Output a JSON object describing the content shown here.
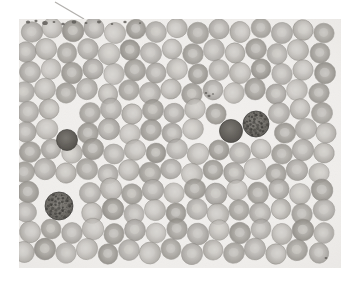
{
  "figure": {
    "kind": "micrograph",
    "title": "",
    "caption": "",
    "page_background": "#ffffff"
  },
  "micrograph": {
    "name": "blood-smear-micrograph",
    "frame": {
      "x": 19,
      "y": 19,
      "width": 322,
      "height": 249
    },
    "field_background": "#f2f0ee",
    "vignette_color": "#e8e5e2",
    "colors": {
      "rbc_fill": "#a9a7a4",
      "rbc_fill_light": "#b9b7b3",
      "rbc_fill_dark": "#98958f",
      "rbc_edge": "#8e8b86",
      "rbc_pallor": "#cfcdc9",
      "leukocyte_dark": "#5e5c5a",
      "leukocyte_granular": "#6e6b66",
      "leukocyte_granule": "#3f3d3a",
      "debris": "#5a5854",
      "pointer": "#b2b0ad"
    },
    "annotations": {
      "pointer_line": {
        "label": "pointer-leader-line",
        "x1": 55,
        "y1": 2,
        "x2": 84,
        "y2": 19,
        "stroke": "#b2b0ad",
        "width": 1.3
      }
    },
    "cells": {
      "erythrocyte_count": 168,
      "leukocyte_count": 3,
      "erythrocytes": [
        [
          32,
          32,
          10.5,
          0.86
        ],
        [
          52,
          28,
          10.0,
          0.8
        ],
        [
          73,
          31,
          10.8,
          0.92
        ],
        [
          94,
          28,
          10.2,
          0.84
        ],
        [
          115,
          33,
          10.6,
          0.78
        ],
        [
          136,
          29,
          9.8,
          0.9
        ],
        [
          156,
          32,
          10.4,
          0.82
        ],
        [
          177,
          28,
          10.0,
          0.88
        ],
        [
          198,
          33,
          10.7,
          0.8
        ],
        [
          219,
          29,
          10.1,
          0.86
        ],
        [
          240,
          32,
          10.3,
          0.9
        ],
        [
          261,
          28,
          9.9,
          0.78
        ],
        [
          282,
          33,
          10.6,
          0.84
        ],
        [
          303,
          30,
          10.2,
          0.92
        ],
        [
          324,
          33,
          10.0,
          0.8
        ],
        [
          26,
          52,
          10.2,
          0.84
        ],
        [
          46,
          49,
          10.6,
          0.9
        ],
        [
          67,
          53,
          10.0,
          0.78
        ],
        [
          88,
          49,
          10.4,
          0.86
        ],
        [
          109,
          54,
          10.8,
          0.82
        ],
        [
          130,
          50,
          10.1,
          0.92
        ],
        [
          151,
          53,
          10.5,
          0.8
        ],
        [
          172,
          49,
          9.9,
          0.88
        ],
        [
          193,
          54,
          10.3,
          0.84
        ],
        [
          214,
          50,
          10.7,
          0.78
        ],
        [
          235,
          53,
          10.0,
          0.9
        ],
        [
          256,
          49,
          10.4,
          0.86
        ],
        [
          277,
          54,
          10.2,
          0.82
        ],
        [
          298,
          50,
          10.6,
          0.88
        ],
        [
          320,
          53,
          10.0,
          0.84
        ],
        [
          30,
          72,
          10.5,
          0.88
        ],
        [
          51,
          69,
          10.0,
          0.8
        ],
        [
          72,
          73,
          10.7,
          0.86
        ],
        [
          93,
          69,
          10.2,
          0.92
        ],
        [
          114,
          74,
          10.4,
          0.78
        ],
        [
          135,
          70,
          10.8,
          0.84
        ],
        [
          156,
          73,
          10.1,
          0.9
        ],
        [
          177,
          69,
          10.5,
          0.82
        ],
        [
          198,
          74,
          9.9,
          0.88
        ],
        [
          219,
          70,
          10.3,
          0.8
        ],
        [
          240,
          73,
          10.6,
          0.86
        ],
        [
          261,
          69,
          10.0,
          0.92
        ],
        [
          282,
          74,
          10.4,
          0.78
        ],
        [
          303,
          70,
          10.2,
          0.84
        ],
        [
          325,
          73,
          10.6,
          0.9
        ],
        [
          24,
          92,
          10.3,
          0.82
        ],
        [
          45,
          89,
          10.7,
          0.88
        ],
        [
          66,
          93,
          10.1,
          0.8
        ],
        [
          87,
          89,
          10.5,
          0.86
        ],
        [
          108,
          94,
          9.9,
          0.92
        ],
        [
          129,
          90,
          10.3,
          0.78
        ],
        [
          150,
          93,
          10.7,
          0.84
        ],
        [
          171,
          89,
          10.1,
          0.9
        ],
        [
          192,
          94,
          10.5,
          0.82
        ],
        [
          213,
          90,
          9.9,
          0.88
        ],
        [
          234,
          93,
          10.3,
          0.8
        ],
        [
          255,
          89,
          10.7,
          0.86
        ],
        [
          276,
          94,
          10.1,
          0.92
        ],
        [
          297,
          90,
          10.5,
          0.78
        ],
        [
          319,
          93,
          10.0,
          0.84
        ],
        [
          28,
          112,
          10.6,
          0.86
        ],
        [
          49,
          109,
          10.0,
          0.92
        ],
        [
          90,
          113,
          10.4,
          0.78
        ],
        [
          111,
          109,
          10.8,
          0.84
        ],
        [
          132,
          114,
          10.2,
          0.9
        ],
        [
          153,
          110,
          10.6,
          0.82
        ],
        [
          174,
          113,
          10.0,
          0.88
        ],
        [
          195,
          109,
          10.4,
          0.8
        ],
        [
          216,
          114,
          10.2,
          0.86
        ],
        [
          279,
          113,
          10.5,
          0.84
        ],
        [
          300,
          109,
          10.1,
          0.9
        ],
        [
          322,
          113,
          10.5,
          0.8
        ],
        [
          26,
          132,
          10.2,
          0.88
        ],
        [
          47,
          129,
          10.6,
          0.8
        ],
        [
          88,
          133,
          10.4,
          0.86
        ],
        [
          109,
          129,
          10.8,
          0.92
        ],
        [
          130,
          134,
          10.2,
          0.78
        ],
        [
          151,
          130,
          10.6,
          0.84
        ],
        [
          172,
          133,
          10.0,
          0.9
        ],
        [
          193,
          129,
          10.4,
          0.82
        ],
        [
          285,
          133,
          10.3,
          0.88
        ],
        [
          306,
          129,
          10.7,
          0.8
        ],
        [
          326,
          133,
          10.1,
          0.86
        ],
        [
          30,
          152,
          10.5,
          0.84
        ],
        [
          51,
          149,
          9.9,
          0.9
        ],
        [
          72,
          153,
          10.3,
          0.82
        ],
        [
          93,
          149,
          10.7,
          0.88
        ],
        [
          114,
          154,
          10.1,
          0.8
        ],
        [
          135,
          150,
          10.5,
          0.86
        ],
        [
          156,
          153,
          9.9,
          0.92
        ],
        [
          177,
          149,
          10.3,
          0.78
        ],
        [
          198,
          154,
          10.7,
          0.84
        ],
        [
          219,
          150,
          10.1,
          0.9
        ],
        [
          240,
          153,
          10.5,
          0.82
        ],
        [
          261,
          149,
          9.9,
          0.88
        ],
        [
          282,
          154,
          10.3,
          0.8
        ],
        [
          303,
          150,
          10.7,
          0.86
        ],
        [
          324,
          153,
          10.1,
          0.92
        ],
        [
          24,
          172,
          10.4,
          0.8
        ],
        [
          45,
          169,
          10.8,
          0.86
        ],
        [
          66,
          173,
          10.2,
          0.92
        ],
        [
          87,
          169,
          10.6,
          0.78
        ],
        [
          108,
          174,
          10.0,
          0.84
        ],
        [
          129,
          170,
          10.4,
          0.9
        ],
        [
          150,
          173,
          10.8,
          0.82
        ],
        [
          171,
          169,
          10.2,
          0.88
        ],
        [
          192,
          174,
          10.6,
          0.8
        ],
        [
          213,
          170,
          10.0,
          0.86
        ],
        [
          234,
          173,
          10.4,
          0.92
        ],
        [
          255,
          169,
          10.8,
          0.78
        ],
        [
          276,
          174,
          10.2,
          0.84
        ],
        [
          297,
          170,
          10.6,
          0.9
        ],
        [
          319,
          173,
          10.0,
          0.82
        ],
        [
          28,
          192,
          10.7,
          0.88
        ],
        [
          90,
          193,
          10.5,
          0.84
        ],
        [
          111,
          189,
          10.9,
          0.9
        ],
        [
          132,
          194,
          10.3,
          0.82
        ],
        [
          153,
          190,
          10.7,
          0.88
        ],
        [
          174,
          193,
          10.1,
          0.8
        ],
        [
          195,
          189,
          10.5,
          0.86
        ],
        [
          216,
          194,
          10.9,
          0.92
        ],
        [
          237,
          190,
          10.3,
          0.78
        ],
        [
          258,
          193,
          10.7,
          0.84
        ],
        [
          279,
          189,
          10.1,
          0.9
        ],
        [
          300,
          194,
          10.5,
          0.82
        ],
        [
          322,
          190,
          10.9,
          0.88
        ],
        [
          26,
          212,
          10.3,
          0.8
        ],
        [
          92,
          213,
          10.4,
          0.86
        ],
        [
          113,
          209,
          10.8,
          0.92
        ],
        [
          134,
          214,
          10.2,
          0.78
        ],
        [
          155,
          210,
          10.6,
          0.84
        ],
        [
          176,
          213,
          10.0,
          0.9
        ],
        [
          197,
          209,
          10.4,
          0.82
        ],
        [
          218,
          214,
          10.8,
          0.88
        ],
        [
          239,
          210,
          10.2,
          0.8
        ],
        [
          260,
          213,
          10.6,
          0.86
        ],
        [
          281,
          209,
          10.0,
          0.92
        ],
        [
          302,
          214,
          10.4,
          0.78
        ],
        [
          324,
          210,
          10.8,
          0.84
        ],
        [
          30,
          232,
          10.6,
          0.9
        ],
        [
          51,
          229,
          10.0,
          0.82
        ],
        [
          72,
          233,
          10.4,
          0.88
        ],
        [
          93,
          229,
          10.8,
          0.8
        ],
        [
          114,
          234,
          10.2,
          0.86
        ],
        [
          135,
          230,
          10.6,
          0.92
        ],
        [
          156,
          233,
          10.0,
          0.78
        ],
        [
          177,
          229,
          10.4,
          0.84
        ],
        [
          198,
          234,
          10.8,
          0.9
        ],
        [
          219,
          230,
          10.2,
          0.82
        ],
        [
          240,
          233,
          10.6,
          0.88
        ],
        [
          261,
          229,
          10.0,
          0.8
        ],
        [
          282,
          234,
          10.4,
          0.86
        ],
        [
          303,
          230,
          10.8,
          0.92
        ],
        [
          324,
          233,
          10.2,
          0.78
        ],
        [
          24,
          252,
          10.4,
          0.86
        ],
        [
          45,
          249,
          10.8,
          0.92
        ],
        [
          66,
          253,
          10.2,
          0.78
        ],
        [
          87,
          249,
          10.6,
          0.84
        ],
        [
          108,
          254,
          10.0,
          0.9
        ],
        [
          129,
          250,
          10.4,
          0.82
        ],
        [
          150,
          253,
          10.8,
          0.88
        ],
        [
          171,
          249,
          10.2,
          0.8
        ],
        [
          192,
          254,
          10.6,
          0.86
        ],
        [
          213,
          250,
          10.0,
          0.92
        ],
        [
          234,
          253,
          10.4,
          0.78
        ],
        [
          255,
          249,
          10.8,
          0.84
        ],
        [
          276,
          254,
          10.2,
          0.9
        ],
        [
          297,
          250,
          10.6,
          0.82
        ],
        [
          319,
          253,
          10.0,
          0.88
        ]
      ],
      "leukocytes": [
        {
          "label": "lymphocyte-dark-small",
          "x": 67,
          "y": 140,
          "r": 10.5,
          "style": "solid"
        },
        {
          "label": "lymphocyte-dark-center",
          "x": 231,
          "y": 131,
          "r": 11.5,
          "style": "solid"
        },
        {
          "label": "granulocyte-center-right",
          "x": 256,
          "y": 124,
          "r": 13.0,
          "style": "granular"
        },
        {
          "label": "granulocyte-bottom-left",
          "x": 59,
          "y": 206,
          "r": 14.0,
          "style": "granular"
        }
      ],
      "debris_specks": [
        [
          28,
          22,
          2.2
        ],
        [
          36,
          21,
          1.6
        ],
        [
          45,
          23,
          2.8
        ],
        [
          54,
          22,
          1.4
        ],
        [
          63,
          24,
          1.8
        ],
        [
          74,
          22,
          2.4
        ],
        [
          86,
          23,
          1.5
        ],
        [
          99,
          22,
          2.0
        ],
        [
          112,
          24,
          1.3
        ],
        [
          125,
          22,
          1.7
        ],
        [
          140,
          23,
          1.2
        ],
        [
          209,
          96,
          1.6
        ],
        [
          206,
          93,
          1.3
        ],
        [
          213,
          94,
          1.1
        ],
        [
          326,
          258,
          1.4
        ]
      ]
    }
  }
}
